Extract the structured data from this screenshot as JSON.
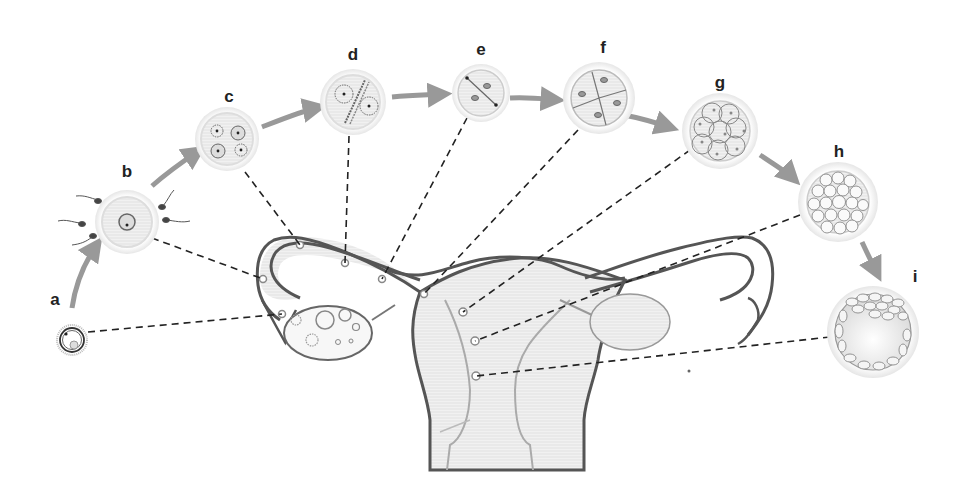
{
  "diagram": {
    "stages": [
      {
        "id": "a",
        "label": "a",
        "description": "oocyte (ovulation)"
      },
      {
        "id": "b",
        "label": "b",
        "description": "fertilization (sperm around oocyte)"
      },
      {
        "id": "c",
        "label": "c",
        "description": "pronuclei"
      },
      {
        "id": "d",
        "label": "d",
        "description": "first mitotic spindle"
      },
      {
        "id": "e",
        "label": "e",
        "description": "2-cell stage"
      },
      {
        "id": "f",
        "label": "f",
        "description": "4-cell stage"
      },
      {
        "id": "g",
        "label": "g",
        "description": "8-cell stage"
      },
      {
        "id": "h",
        "label": "h",
        "description": "morula"
      },
      {
        "id": "i",
        "label": "i",
        "description": "blastocyst (implantation)"
      }
    ],
    "colors": {
      "outline": "#555555",
      "fill": "#eeeeee",
      "arrow": "#999999",
      "dash": "#222222",
      "nucleus": "#888888"
    }
  }
}
